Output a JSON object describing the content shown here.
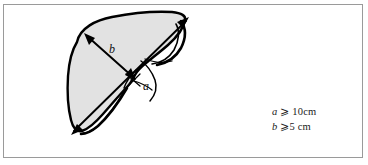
{
  "figure": {
    "name": "liver-measurement-diagram",
    "type": "anatomical-line-drawing",
    "organ": "liver",
    "frame": {
      "border_color": "#9a9a9a",
      "background_color": "#ffffff"
    },
    "shape": {
      "fill_color": "#e2e2e2",
      "outline_color": "#000000"
    }
  },
  "labels": {
    "dimension_a": "a",
    "dimension_b": "b"
  },
  "legend": {
    "lines": [
      {
        "variable": "a",
        "relation": "⩾",
        "value": "10",
        "unit": "cm",
        "text": "a ⩾ 10cm"
      },
      {
        "variable": "b",
        "relation": "⩾",
        "value": "5",
        "unit": "cm",
        "text": "b ⩾5 cm"
      }
    ],
    "line_a_var": "a",
    "line_a_rest": "⩾ 10cm",
    "line_b_var": "b",
    "line_b_rest": "⩾5 cm"
  },
  "annotations": {
    "arrow_a_description": "double-headed arrow spanning short axis near hilum",
    "arrow_b_description": "double-headed arrow spanning long axis of left lobe"
  }
}
